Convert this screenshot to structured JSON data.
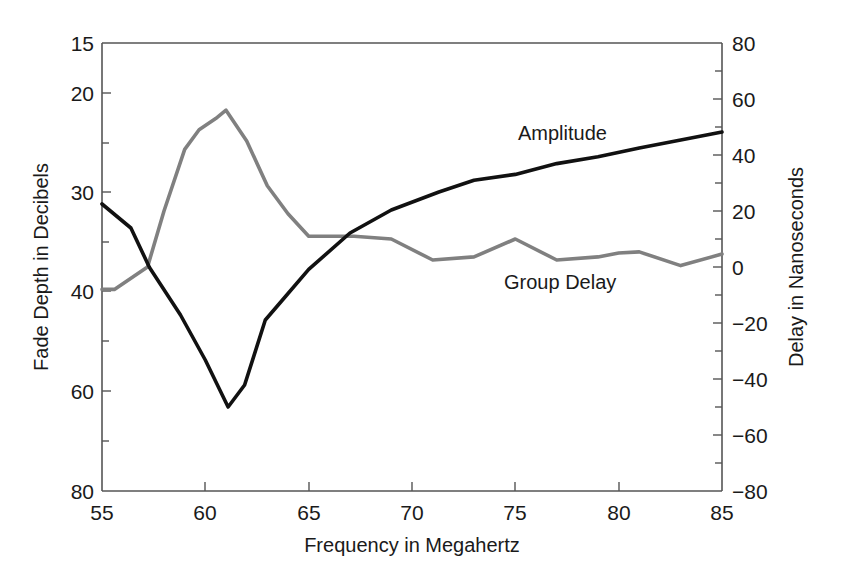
{
  "chart_data": {
    "type": "line",
    "title": "",
    "xlabel": "Frequency in Megahertz",
    "ylabel_left": "Fade Depth in Decibels",
    "ylabel_right": "Delay in Nanoseconds",
    "xlim": [
      55,
      85
    ],
    "x_ticks": [
      55,
      60,
      65,
      70,
      75,
      80,
      85
    ],
    "y_left_ticks": [
      15,
      20,
      30,
      40,
      60,
      80
    ],
    "y_left_scale": "nonlinear (equally spaced labeled ticks with unlabeled minor ticks at 25, 35, 50, 70)",
    "y_left_minor_ticks": [
      25,
      35,
      50,
      70
    ],
    "y_left_inverted": true,
    "y_right_ticks": [
      80,
      60,
      40,
      20,
      0,
      -20,
      -40,
      -60,
      -80
    ],
    "y_right_ylim": [
      -80,
      80
    ],
    "grid": false,
    "legend": "inline labels",
    "series": [
      {
        "name": "Amplitude",
        "axis": "left",
        "color": "#111111",
        "x": [
          55,
          56.4,
          57.3,
          58.8,
          60,
          61.1,
          61.9,
          62.9,
          63.9,
          65,
          67,
          69,
          71.3,
          73,
          75,
          77,
          79,
          81,
          83,
          85
        ],
        "values": [
          31.2,
          33.6,
          37.6,
          44.8,
          53.8,
          63.2,
          58.8,
          45.8,
          41,
          37.8,
          34.1,
          31.8,
          30,
          28.8,
          28.2,
          27.1,
          26.4,
          25.5,
          24.7,
          23.9
        ]
      },
      {
        "name": "Group Delay",
        "axis": "right",
        "color": "#808080",
        "x": [
          55,
          55.6,
          57.2,
          58,
          59,
          59.7,
          60.5,
          61,
          62,
          63,
          64,
          65,
          67.2,
          69,
          71,
          73,
          75,
          77,
          79,
          80,
          81,
          83,
          85
        ],
        "values": [
          -8,
          -8,
          0,
          20,
          42,
          49,
          53,
          56,
          45,
          29,
          19,
          11,
          11,
          10,
          2.5,
          3.6,
          10,
          2.5,
          3.6,
          5,
          5.4,
          0.5,
          4.6
        ]
      }
    ],
    "annotations": [
      {
        "text": "Amplitude",
        "near_x": 71,
        "near_y_right": 48
      },
      {
        "text": "Group Delay",
        "near_x": 73,
        "near_y_right": -6
      }
    ]
  },
  "labels": {
    "x_axis_title": "Frequency in Megahertz",
    "left_axis_title": "Fade Depth in Decibels",
    "right_axis_title": "Delay in Nanoseconds",
    "amplitude_label": "Amplitude",
    "group_delay_label": "Group Delay"
  },
  "ticks": {
    "x": [
      "55",
      "60",
      "65",
      "70",
      "75",
      "80",
      "85"
    ],
    "left": [
      "15",
      "20",
      "30",
      "40",
      "60",
      "80"
    ],
    "right": [
      "80",
      "60",
      "40",
      "20",
      "0",
      "−20",
      "−40",
      "−60",
      "−80"
    ]
  },
  "colors": {
    "amplitude": "#111111",
    "group_delay": "#808080",
    "axis": "#555555"
  }
}
